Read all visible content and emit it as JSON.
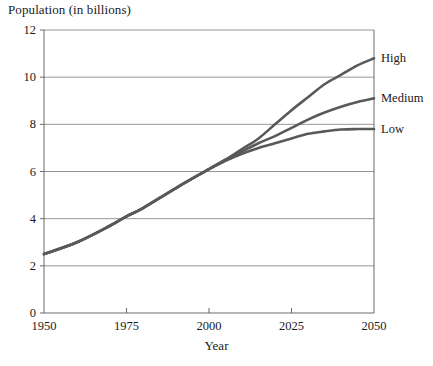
{
  "chart_data": {
    "type": "line",
    "title": "",
    "ylabel": "Population (in billions)",
    "xlabel": "Year",
    "xlim": [
      1950,
      2050
    ],
    "ylim": [
      0,
      12
    ],
    "xticks": [
      1950,
      1975,
      2000,
      2025,
      2050
    ],
    "yticks": [
      0,
      2,
      4,
      6,
      8,
      10,
      12
    ],
    "grid": "horizontal",
    "legend_position": "right-inline-labels",
    "x": [
      1950,
      1960,
      1970,
      1975,
      1980,
      1990,
      2000,
      2005,
      2010,
      2015,
      2020,
      2025,
      2030,
      2035,
      2040,
      2045,
      2050
    ],
    "series": [
      {
        "name": "High",
        "label": "High",
        "color": "#595959",
        "values": [
          2.5,
          3.0,
          3.7,
          4.1,
          4.45,
          5.3,
          6.1,
          6.5,
          6.95,
          7.4,
          8.0,
          8.6,
          9.15,
          9.7,
          10.1,
          10.5,
          10.8
        ]
      },
      {
        "name": "Medium",
        "label": "Medium",
        "color": "#595959",
        "values": [
          2.5,
          3.0,
          3.7,
          4.1,
          4.45,
          5.3,
          6.1,
          6.5,
          6.85,
          7.2,
          7.5,
          7.85,
          8.2,
          8.5,
          8.75,
          8.95,
          9.1
        ]
      },
      {
        "name": "Low",
        "label": "Low",
        "color": "#595959",
        "values": [
          2.5,
          3.0,
          3.7,
          4.1,
          4.45,
          5.3,
          6.1,
          6.45,
          6.75,
          7.0,
          7.2,
          7.4,
          7.6,
          7.7,
          7.78,
          7.8,
          7.8
        ]
      }
    ],
    "ytick_labels": [
      "0",
      "2",
      "4",
      "6",
      "8",
      "10",
      "12"
    ],
    "xtick_labels": [
      "1950",
      "1975",
      "2000",
      "2025",
      "2050"
    ],
    "axis_color": "#6b6b6b",
    "grid_color": "#8a8a8a",
    "line_color": "#595959"
  }
}
